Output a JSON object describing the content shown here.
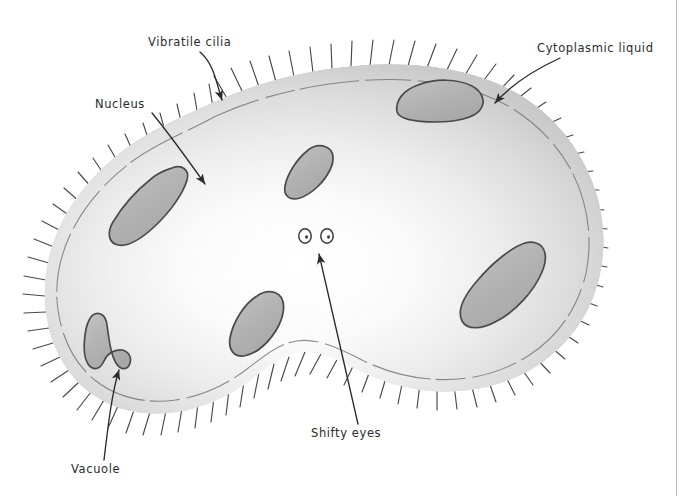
{
  "figure": {
    "type": "hand-drawn biology diagram",
    "medium": "pencil and grey watercolor wash on white paper",
    "title": "",
    "page_border": {
      "side": "right",
      "color": "#b9b9b9"
    }
  },
  "labels": [
    {
      "id": "vibratile-cilia",
      "text": "Vibratile cilia",
      "x": 148,
      "y": 43,
      "anchor": "start"
    },
    {
      "id": "cytoplasmic-liquid",
      "text": "Cytoplasmic liquid",
      "x": 537,
      "y": 50,
      "anchor": "start"
    },
    {
      "id": "nucleus",
      "text": "Nucleus",
      "x": 95,
      "y": 105,
      "anchor": "start"
    },
    {
      "id": "shifty-eyes",
      "text": "Shifty eyes",
      "x": 310,
      "y": 437,
      "anchor": "start"
    },
    {
      "id": "vacuole",
      "text": "Vacuole",
      "x": 71,
      "y": 472,
      "anchor": "start"
    }
  ],
  "leader_lines": [
    {
      "id": "leader-vibratile-cilia",
      "for": "Vibratile cilia",
      "from": [
        205,
        52
      ],
      "to": [
        222,
        102
      ],
      "arrow": true
    },
    {
      "id": "leader-cytoplasmic-liquid",
      "for": "Cytoplasmic liquid",
      "from": [
        540,
        58
      ],
      "to": [
        494,
        104
      ],
      "arrow": true
    },
    {
      "id": "leader-nucleus",
      "for": "Nucleus",
      "from": [
        143,
        113
      ],
      "to": [
        208,
        186
      ],
      "arrow": true
    },
    {
      "id": "leader-shifty-eyes",
      "for": "Shifty eyes",
      "from": [
        357,
        424
      ],
      "to": [
        318,
        252
      ],
      "arrow": true
    },
    {
      "id": "leader-vacuole",
      "for": "Vacuole",
      "from": [
        103,
        461
      ],
      "to": [
        120,
        367
      ],
      "arrow": true
    }
  ],
  "structures": {
    "cell_membrane": {
      "name": "cell membrane",
      "stroke": "#4a4a4a",
      "fill_light": "#f5f5f5",
      "fill_rim": "#9a9a9a"
    },
    "cytoplasm": {
      "name": "cytoplasmic liquid",
      "fill": "#e3e3e3"
    },
    "cilia": {
      "name": "vibratile cilia",
      "count": 74,
      "stroke": "#3a3a3a"
    },
    "organelles": [
      {
        "id": "nucleus",
        "label": "Nucleus",
        "cx": 150,
        "cy": 210,
        "shape": "curved-bean"
      },
      {
        "id": "organelle-top",
        "label": "",
        "cx": 440,
        "cy": 98,
        "shape": "dome"
      },
      {
        "id": "organelle-center",
        "label": "",
        "cx": 305,
        "cy": 172,
        "shape": "bean"
      },
      {
        "id": "organelle-right",
        "label": "",
        "cx": 495,
        "cy": 290,
        "shape": "curved-bean"
      },
      {
        "id": "organelle-bottom",
        "label": "",
        "cx": 252,
        "cy": 322,
        "shape": "oval"
      },
      {
        "id": "vacuole",
        "label": "Vacuole",
        "cx": 110,
        "cy": 345,
        "shape": "elongated-curve"
      }
    ],
    "eyes": {
      "name": "shifty eyes",
      "count": 2,
      "left": {
        "cx": 305,
        "cy": 235,
        "rx": 6,
        "ry": 7
      },
      "right": {
        "cx": 326,
        "cy": 236,
        "rx": 6,
        "ry": 7
      },
      "pupil_offset_x": 1.5
    }
  },
  "colors": {
    "paper": "#ffffff",
    "ink": "#2b2b2b",
    "wash_light": "#f2f2f2",
    "wash_mid": "#d2d2d2",
    "wash_dark": "#9e9e9e",
    "organelle_fill": "#b8b8b8",
    "border_line": "#b9b9b9"
  }
}
